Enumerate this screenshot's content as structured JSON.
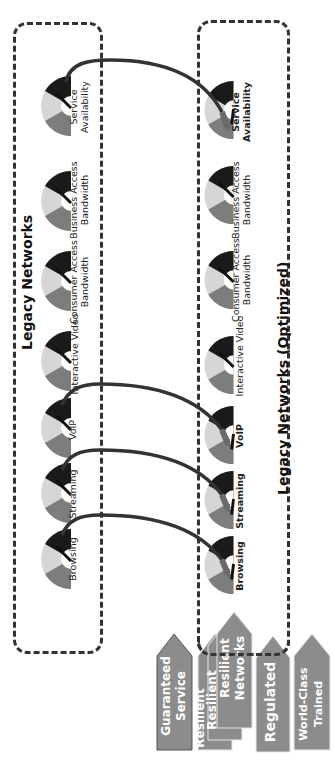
{
  "diagram": {
    "orientation": "rotated-90-ccw",
    "colors": {
      "dash_border": "#333333",
      "arrow": "#3a3a3a",
      "gauge_dark": "#1a1a1a",
      "gauge_light": "#c8c8c8",
      "gauge_mid": "#8a8a8a",
      "tag_fill": "#8c8c8c",
      "tag_text": "#ffffff"
    },
    "legacy": {
      "title": "Legacy Networks",
      "gauges": [
        {
          "id": "service-availability",
          "line1": "Service",
          "line2": "Availability"
        },
        {
          "id": "business-access-bandwidth",
          "line1": "Business Access",
          "line2": "Bandwidth"
        },
        {
          "id": "consumer-access-bandwidth",
          "line1": "Consumer Access",
          "line2": "Bandwidth"
        },
        {
          "id": "interactive-video",
          "line1": "Interactive Video",
          "line2": ""
        },
        {
          "id": "voip",
          "line1": "VoIP",
          "line2": ""
        },
        {
          "id": "streaming",
          "line1": "Streaming",
          "line2": ""
        },
        {
          "id": "browsing",
          "line1": "Browsing",
          "line2": ""
        }
      ]
    },
    "optimized": {
      "title": "Legacy  Networks (Optimized)",
      "gauges": [
        {
          "id": "service-availability",
          "line1": "Service",
          "line2": "Availability"
        },
        {
          "id": "business-access-bandwidth",
          "line1": "Business Access",
          "line2": "Bandwidth"
        },
        {
          "id": "consumer-access-bandwidth",
          "line1": "Consumer Access",
          "line2": "Bandwidth"
        },
        {
          "id": "interactive-video",
          "line1": "Interactive Video",
          "line2": ""
        },
        {
          "id": "voip",
          "line1": "VoIP",
          "line2": ""
        },
        {
          "id": "streaming",
          "line1": "Streaming",
          "line2": ""
        },
        {
          "id": "browsing",
          "line1": "Browsing",
          "line2": ""
        }
      ]
    },
    "arrows": [
      {
        "from": "Service Availability",
        "to": "Service Availability"
      },
      {
        "from": "VoIP",
        "to": "VoIP"
      },
      {
        "from": "Streaming",
        "to": "Streaming"
      },
      {
        "from": "Browsing",
        "to": "Browsing"
      }
    ],
    "tags": [
      {
        "id": "guaranteed-service",
        "line1": "Guaranteed",
        "line2": "Service"
      },
      {
        "id": "resilient-back2",
        "line1": "Resilient",
        "line2": ""
      },
      {
        "id": "resilient-back1",
        "line1": "Resilient",
        "line2": ""
      },
      {
        "id": "resilient-networks",
        "line1": "Resilient",
        "line2": "Networks"
      },
      {
        "id": "regulated",
        "line1": "Regulated",
        "line2": ""
      },
      {
        "id": "world-class-trained",
        "line1": "World-Class",
        "line2": "Trained"
      }
    ]
  }
}
